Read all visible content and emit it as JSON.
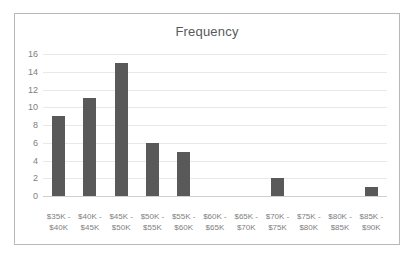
{
  "chart_data": {
    "type": "bar",
    "title": "Frequency",
    "xlabel": "",
    "ylabel": "",
    "categories": [
      "$35K - $40K",
      "$40K - $45K",
      "$45K - $50K",
      "$50K - $55K",
      "$55K - $60K",
      "$60K - $65K",
      "$65K - $70K",
      "$70K - $75K",
      "$75K - $80K",
      "$80K - $85K",
      "$85K - $90K"
    ],
    "category_lines": [
      {
        "line1": "$35K -",
        "line2": "$40K"
      },
      {
        "line1": "$40K -",
        "line2": "$45K"
      },
      {
        "line1": "$45K -",
        "line2": "$50K"
      },
      {
        "line1": "$50K -",
        "line2": "$55K"
      },
      {
        "line1": "$55K -",
        "line2": "$60K"
      },
      {
        "line1": "$60K -",
        "line2": "$65K"
      },
      {
        "line1": "$65K -",
        "line2": "$70K"
      },
      {
        "line1": "$70K -",
        "line2": "$75K"
      },
      {
        "line1": "$75K -",
        "line2": "$80K"
      },
      {
        "line1": "$80K -",
        "line2": "$85K"
      },
      {
        "line1": "$85K -",
        "line2": "$90K"
      }
    ],
    "values": [
      9,
      11,
      15,
      6,
      5,
      0,
      0,
      2,
      0,
      0,
      1
    ],
    "ylim": [
      0,
      16
    ],
    "yticks": [
      0,
      2,
      4,
      6,
      8,
      10,
      12,
      14,
      16
    ],
    "grid": true,
    "legend": false,
    "colors": {
      "bar": "#595959",
      "gridline": "#e8e8e8",
      "axis": "#d0d0d0",
      "tick_text": "#808080",
      "title_text": "#595959",
      "frame_border": "#b8b8b8",
      "background": "#ffffff"
    }
  }
}
